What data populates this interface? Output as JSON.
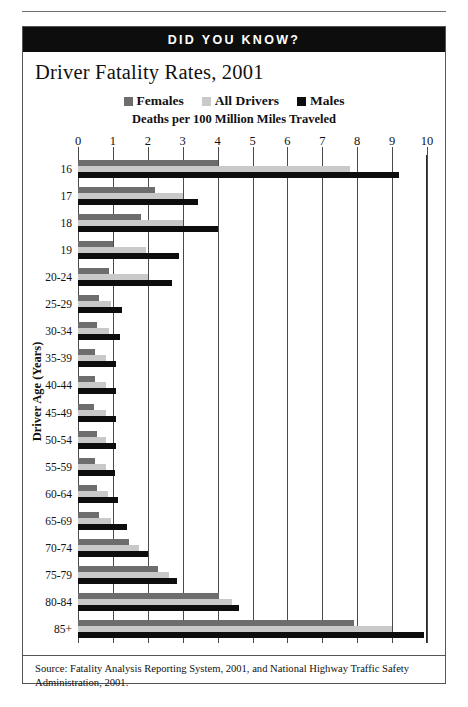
{
  "banner": {
    "label": "DID YOU KNOW?"
  },
  "chart": {
    "title": "Driver Fatality Rates, 2001",
    "axis_caption": "Deaths per 100 Million Miles Traveled",
    "y_axis_title": "Driver Age (Years)",
    "source_note": "Source: Fatality Analysis Reporting System, 2001, and National Highway Traffic Safety Administration, 2001."
  },
  "legend": [
    {
      "label": "Females",
      "color": "#6d6d6d",
      "swatch_icon": "square-swatch-icon"
    },
    {
      "label": "All Drivers",
      "color": "#c9c9c9",
      "swatch_icon": "square-swatch-icon"
    },
    {
      "label": "Males",
      "color": "#0d0d0d",
      "swatch_icon": "square-swatch-icon"
    }
  ],
  "chart_data": {
    "type": "bar",
    "orientation": "horizontal",
    "title": "Driver Fatality Rates, 2001",
    "subtitle": "Deaths per 100 Million Miles Traveled",
    "xlabel": "Deaths per 100 Million Miles Traveled",
    "ylabel": "Driver Age (Years)",
    "xlim": [
      0,
      10
    ],
    "xticks": [
      0,
      1,
      2,
      3,
      4,
      5,
      6,
      7,
      8,
      9,
      10
    ],
    "xtick_labels": [
      "0",
      "1",
      "2",
      "3",
      "4",
      "5",
      "6",
      "7",
      "8",
      "9",
      "10"
    ],
    "grid": true,
    "grid_axis": "x",
    "legend_position": "top-center",
    "categories": [
      "16",
      "17",
      "18",
      "19",
      "20-24",
      "25-29",
      "30-34",
      "35-39",
      "40-44",
      "45-49",
      "50-54",
      "55-59",
      "60-64",
      "65-69",
      "70-74",
      "75-79",
      "80-84",
      "85+"
    ],
    "series": [
      {
        "name": "Females",
        "color": "#6d6d6d",
        "values": [
          4.0,
          2.2,
          1.8,
          1.0,
          0.9,
          0.6,
          0.55,
          0.5,
          0.5,
          0.45,
          0.55,
          0.5,
          0.55,
          0.6,
          1.45,
          2.3,
          4.05,
          7.9
        ]
      },
      {
        "name": "All Drivers",
        "color": "#c9c9c9",
        "values": [
          7.8,
          3.0,
          3.0,
          1.95,
          2.0,
          0.95,
          0.9,
          0.8,
          0.8,
          0.8,
          0.8,
          0.8,
          0.85,
          0.95,
          1.75,
          2.6,
          4.4,
          9.0
        ]
      },
      {
        "name": "Males",
        "color": "#0d0d0d",
        "values": [
          9.2,
          3.45,
          4.0,
          2.9,
          2.7,
          1.25,
          1.2,
          1.1,
          1.1,
          1.1,
          1.1,
          1.05,
          1.15,
          1.4,
          2.0,
          2.85,
          4.6,
          9.9
        ]
      }
    ]
  }
}
